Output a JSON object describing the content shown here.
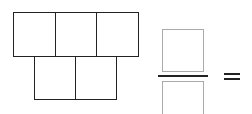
{
  "figure": {
    "type": "fraction-area-model",
    "top_row_cells": 3,
    "bottom_row_cells": 2,
    "total_cells": 5,
    "shaded_cells": 0,
    "numerator_box": "",
    "denominator_box": "",
    "operator": "="
  },
  "colors": {
    "grid_line": "#222222",
    "answer_box": "#aaaaaa",
    "background": "#ffffff"
  }
}
